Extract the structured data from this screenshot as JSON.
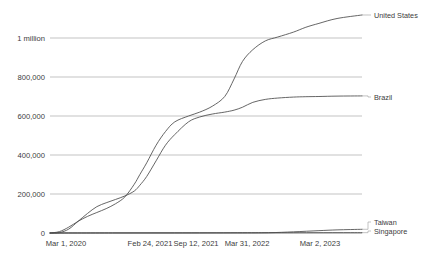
{
  "chart_data": {
    "type": "line",
    "title": "",
    "subtitle": "",
    "xlabel": "",
    "ylabel": "",
    "grid": true,
    "legend_position": "right-inline",
    "ylim": [
      0,
      1200000
    ],
    "y_ticks": [
      0,
      200000,
      400000,
      600000,
      800000,
      1000000
    ],
    "y_tick_labels": [
      "0",
      "200,000",
      "400,000",
      "600,000",
      "800,000",
      "1 million"
    ],
    "x_ticks": [
      "Mar 1, 2020",
      "Feb 24, 2021",
      "Sep 12, 2021",
      "Mar 31, 2022",
      "Mar 2, 2023"
    ],
    "x_tick_positions": [
      0,
      0.288,
      0.444,
      0.617,
      0.862
    ],
    "series": [
      {
        "name": "United States",
        "color": "#4a4a4a",
        "label_x": 374,
        "label_y": 15,
        "points": [
          [
            0.0,
            0
          ],
          [
            0.03,
            7000
          ],
          [
            0.06,
            30000
          ],
          [
            0.09,
            60000
          ],
          [
            0.12,
            85000
          ],
          [
            0.15,
            105000
          ],
          [
            0.18,
            125000
          ],
          [
            0.21,
            150000
          ],
          [
            0.24,
            185000
          ],
          [
            0.27,
            250000
          ],
          [
            0.288,
            300000
          ],
          [
            0.31,
            360000
          ],
          [
            0.34,
            450000
          ],
          [
            0.37,
            520000
          ],
          [
            0.4,
            570000
          ],
          [
            0.444,
            600000
          ],
          [
            0.48,
            620000
          ],
          [
            0.52,
            650000
          ],
          [
            0.56,
            700000
          ],
          [
            0.59,
            790000
          ],
          [
            0.617,
            880000
          ],
          [
            0.65,
            940000
          ],
          [
            0.69,
            985000
          ],
          [
            0.73,
            1005000
          ],
          [
            0.78,
            1030000
          ],
          [
            0.82,
            1055000
          ],
          [
            0.862,
            1075000
          ],
          [
            0.92,
            1100000
          ],
          [
            1.0,
            1118000
          ]
        ]
      },
      {
        "name": "Brazil",
        "color": "#4a4a4a",
        "label_x": 374,
        "label_y": 97,
        "points": [
          [
            0.0,
            0
          ],
          [
            0.03,
            2000
          ],
          [
            0.06,
            20000
          ],
          [
            0.09,
            60000
          ],
          [
            0.12,
            100000
          ],
          [
            0.15,
            135000
          ],
          [
            0.18,
            155000
          ],
          [
            0.21,
            172000
          ],
          [
            0.24,
            190000
          ],
          [
            0.27,
            215000
          ],
          [
            0.288,
            245000
          ],
          [
            0.31,
            290000
          ],
          [
            0.34,
            370000
          ],
          [
            0.37,
            450000
          ],
          [
            0.4,
            505000
          ],
          [
            0.444,
            570000
          ],
          [
            0.48,
            595000
          ],
          [
            0.52,
            610000
          ],
          [
            0.56,
            620000
          ],
          [
            0.59,
            630000
          ],
          [
            0.617,
            645000
          ],
          [
            0.65,
            670000
          ],
          [
            0.69,
            685000
          ],
          [
            0.73,
            692000
          ],
          [
            0.78,
            697000
          ],
          [
            0.82,
            699000
          ],
          [
            0.862,
            700000
          ],
          [
            0.92,
            702000
          ],
          [
            1.0,
            703000
          ]
        ]
      },
      {
        "name": "Taiwan",
        "color": "#4a4a4a",
        "label_x": 374,
        "label_y": 222,
        "points": [
          [
            0.0,
            0
          ],
          [
            0.2,
            500
          ],
          [
            0.4,
            800
          ],
          [
            0.6,
            900
          ],
          [
            0.7,
            1500
          ],
          [
            0.78,
            6000
          ],
          [
            0.862,
            12000
          ],
          [
            0.92,
            16000
          ],
          [
            1.0,
            19000
          ]
        ]
      },
      {
        "name": "Singapore",
        "color": "#4a4a4a",
        "label_x": 374,
        "label_y": 231,
        "points": [
          [
            0.0,
            0
          ],
          [
            0.2,
            30
          ],
          [
            0.4,
            60
          ],
          [
            0.6,
            800
          ],
          [
            0.7,
            1200
          ],
          [
            0.78,
            1400
          ],
          [
            0.862,
            1600
          ],
          [
            0.92,
            1700
          ],
          [
            1.0,
            1750
          ]
        ]
      }
    ]
  },
  "axis": {
    "y_labels": [
      {
        "text": "1 million",
        "y": 38
      },
      {
        "text": "800,000",
        "y": 77
      },
      {
        "text": "600,000",
        "y": 116
      },
      {
        "text": "400,000",
        "y": 155
      },
      {
        "text": "200,000",
        "y": 194
      },
      {
        "text": "0",
        "y": 233
      }
    ],
    "x_labels": [
      {
        "text": "Mar 1, 2020",
        "x": 66
      },
      {
        "text": "Feb 24, 2021",
        "x": 150
      },
      {
        "text": "Sep 12, 2021",
        "x": 196
      },
      {
        "text": "Mar 31, 2022",
        "x": 247
      },
      {
        "text": "Mar 2, 2023",
        "x": 320
      }
    ]
  }
}
